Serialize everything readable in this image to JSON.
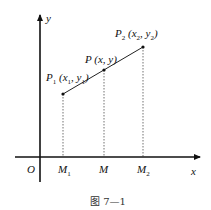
{
  "diagram": {
    "axes": {
      "x_label": "x",
      "y_label": "y",
      "origin_label": "O"
    },
    "points": [
      {
        "id": "P1",
        "name": "P",
        "sub": "1",
        "coords": "(x1, y1)",
        "x_var": "x",
        "x_sub": "1",
        "y_var": "y",
        "y_sub": "1"
      },
      {
        "id": "P",
        "name": "P",
        "coords": "(x, y)"
      },
      {
        "id": "P2",
        "name": "P",
        "sub": "2",
        "coords": "(x2, y2)",
        "x_var": "x",
        "x_sub": "2",
        "y_var": "y",
        "y_sub": "2"
      }
    ],
    "foot_points": [
      {
        "id": "M1",
        "name": "M",
        "sub": "1"
      },
      {
        "id": "M",
        "name": "M",
        "sub": ""
      },
      {
        "id": "M2",
        "name": "M",
        "sub": "2"
      }
    ],
    "caption": "图 7—1"
  }
}
